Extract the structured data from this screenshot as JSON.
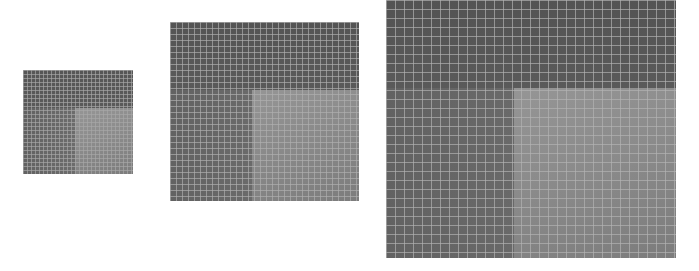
{
  "figure": {
    "background": "#ffffff",
    "panels": [
      {
        "name": "small",
        "x": 23,
        "y": 70,
        "w": 110,
        "h": 104,
        "grid_spacing": 4,
        "split_y": 38,
        "split_x": 52,
        "colors": {
          "top": "#565656",
          "bottom_left": "#6c6c6c",
          "bottom_right": "#8c8c8c",
          "grid": "#a8a8a8"
        }
      },
      {
        "name": "medium",
        "x": 170,
        "y": 22,
        "w": 189,
        "h": 179,
        "grid_spacing": 6,
        "split_y": 68,
        "split_x": 82,
        "colors": {
          "top": "#545454",
          "bottom_left": "#6a6a6a",
          "bottom_right": "#8a8a8a",
          "grid": "#b0b0b0"
        }
      },
      {
        "name": "large",
        "x": 386,
        "y": 0,
        "w": 290,
        "h": 258,
        "grid_spacing": 9,
        "split_y": 88,
        "split_x": 128,
        "colors": {
          "top": "#535353",
          "bottom_left": "#696969",
          "bottom_right": "#8b8b8b",
          "grid": "#b4b4b4"
        }
      }
    ]
  }
}
